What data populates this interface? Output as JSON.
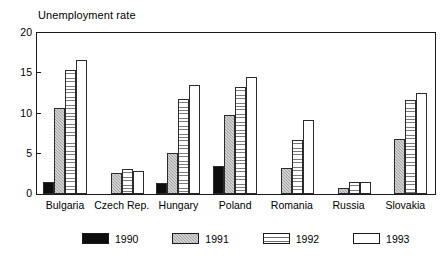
{
  "chart_data": {
    "type": "bar",
    "title": "Unemployment rate",
    "xlabel": "",
    "ylabel": "",
    "ylim": [
      0,
      20
    ],
    "yticks": [
      0,
      5,
      10,
      15,
      20
    ],
    "grid": false,
    "legend_position": "bottom",
    "categories": [
      "Bulgaria",
      "Czech Rep.",
      "Hungary",
      "Poland",
      "Romania",
      "Russia",
      "Slovakia"
    ],
    "series": [
      {
        "name": "1990",
        "values": [
          1.5,
          0.0,
          1.4,
          3.5,
          0.0,
          0.0,
          0.0
        ]
      },
      {
        "name": "1991",
        "values": [
          10.7,
          2.6,
          5.1,
          9.8,
          3.2,
          0.7,
          6.8
        ]
      },
      {
        "name": "1992",
        "values": [
          15.4,
          3.1,
          11.8,
          13.3,
          6.7,
          1.5,
          11.7
        ]
      },
      {
        "name": "1993",
        "values": [
          16.6,
          2.9,
          13.5,
          14.5,
          9.2,
          1.5,
          12.5
        ]
      }
    ]
  },
  "legend": {
    "entries": [
      {
        "label": "1990",
        "pattern": "solid-black"
      },
      {
        "label": "1991",
        "pattern": "gray-checker"
      },
      {
        "label": "1992",
        "pattern": "horizontal-hatch"
      },
      {
        "label": "1993",
        "pattern": "white-open"
      }
    ]
  },
  "axis": {
    "y_tick_labels": [
      "20",
      "15",
      "10",
      "5",
      "0"
    ]
  }
}
